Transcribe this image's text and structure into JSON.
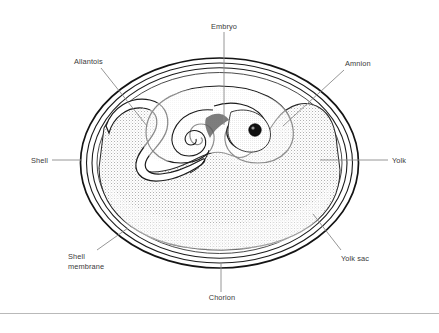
{
  "figure": {
    "background_color": "#ffffff",
    "line_color": "#1a1a1a",
    "label_color": "#3a3a3a",
    "leader_color": "#8a8a8a",
    "yolk_fill_color": "#d9d9d9",
    "embryo_eye_color": "#111111"
  },
  "labels": {
    "embryo": "Embryo",
    "allantois": "Allantois",
    "amnion": "Amnion",
    "shell": "Shell",
    "yolk": "Yolk",
    "shell_membrane_line1": "Shell",
    "shell_membrane_line2": "membrane",
    "yolk_sac": "Yolk sac",
    "chorion": "Chorion"
  }
}
